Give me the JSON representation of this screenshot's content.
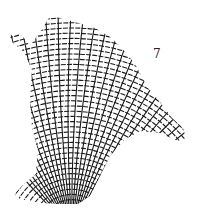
{
  "figure": {
    "label": "7",
    "colors": {
      "ink": "#1a1a1a",
      "background": "#ffffff"
    },
    "outline": [
      [
        10,
        36
      ],
      [
        16,
        32
      ],
      [
        24,
        38
      ],
      [
        30,
        46
      ],
      [
        40,
        32
      ],
      [
        50,
        16
      ],
      [
        60,
        18
      ],
      [
        75,
        22
      ],
      [
        95,
        28
      ],
      [
        112,
        38
      ],
      [
        125,
        52
      ],
      [
        135,
        64
      ],
      [
        148,
        88
      ],
      [
        160,
        102
      ],
      [
        172,
        118
      ],
      [
        183,
        128
      ],
      [
        186,
        138
      ],
      [
        178,
        141
      ],
      [
        160,
        133
      ],
      [
        140,
        131
      ],
      [
        124,
        140
      ],
      [
        110,
        156
      ],
      [
        100,
        176
      ],
      [
        90,
        196
      ],
      [
        78,
        204
      ],
      [
        62,
        204
      ],
      [
        40,
        203
      ],
      [
        20,
        199
      ],
      [
        14,
        194
      ],
      [
        22,
        186
      ],
      [
        36,
        174
      ],
      [
        38,
        150
      ],
      [
        32,
        128
      ],
      [
        30,
        100
      ],
      [
        32,
        70
      ],
      [
        24,
        52
      ],
      [
        12,
        42
      ]
    ],
    "origin": [
      72,
      230
    ],
    "radial_count": 34,
    "arc_count": 26
  }
}
